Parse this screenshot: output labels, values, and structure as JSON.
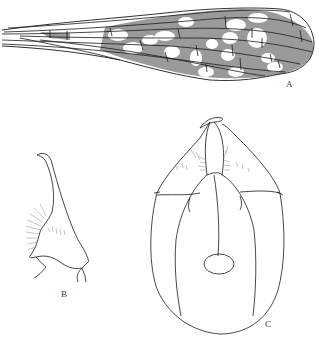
{
  "figure": {
    "panels": [
      {
        "id": "A",
        "label": "A",
        "subject": "wing"
      },
      {
        "id": "B",
        "label": "B",
        "subject": "gonostylus lateral view"
      },
      {
        "id": "C",
        "label": "C",
        "subject": "genitalia ventral view"
      }
    ],
    "colors": {
      "line": "#1a1a1a",
      "wing_shading": "#9a9a9a",
      "background": "#ffffff",
      "setae": "#8a8a8a"
    }
  }
}
